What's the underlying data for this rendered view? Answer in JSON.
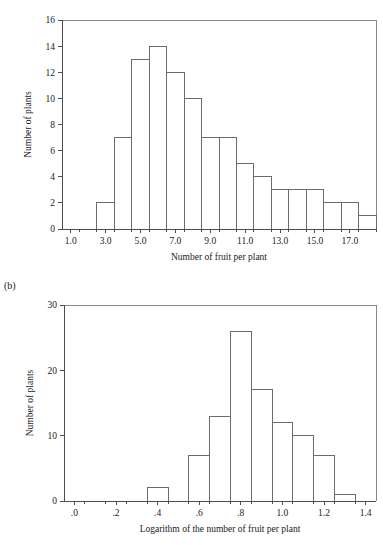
{
  "figure": {
    "panel_b_letter": "(b)"
  },
  "chart_data": [
    {
      "id": "chart-a",
      "type": "bar",
      "title": "",
      "xlabel": "Number of fruit per plant",
      "ylabel": "Number of plants",
      "xlim": [
        0.5,
        18.5
      ],
      "ylim": [
        0,
        16
      ],
      "ytick_values": [
        0,
        2,
        4,
        6,
        8,
        10,
        12,
        14,
        16
      ],
      "ytick_labels": [
        "0",
        "2",
        "4",
        "6",
        "8",
        "10",
        "12",
        "14",
        "16"
      ],
      "xtick_values": [
        1.0,
        3.0,
        5.0,
        7.0,
        9.0,
        11.0,
        13.0,
        15.0,
        17.0
      ],
      "xtick_labels": [
        "1.0",
        "3.0",
        "5.0",
        "7.0",
        "9.0",
        "11.0",
        "13.0",
        "15.0",
        "17.0"
      ],
      "xtick_minor_values": [
        1.5,
        2.5,
        3.5,
        4.5,
        5.5,
        6.5,
        7.5,
        8.5,
        9.5,
        10.5,
        11.5,
        12.5,
        13.5,
        14.5,
        15.5,
        16.5,
        17.5,
        18.5
      ],
      "grid": false,
      "legend": "none",
      "bin_edges": [
        2.5,
        3.5,
        4.5,
        5.5,
        6.5,
        7.5,
        8.5,
        9.5,
        10.5,
        11.5,
        12.5,
        13.5,
        14.5,
        15.5,
        16.5,
        17.5,
        18.5
      ],
      "bin_centers": [
        3,
        4,
        5,
        6,
        7,
        8,
        9,
        10,
        11,
        12,
        13,
        14,
        15,
        16,
        17,
        18
      ],
      "values": [
        2,
        7,
        13,
        14,
        12,
        10,
        7,
        7,
        5,
        4,
        3,
        3,
        3,
        2,
        2,
        1
      ]
    },
    {
      "id": "chart-b",
      "type": "bar",
      "title": "",
      "xlabel": "Logarithm of the number of fruit per plant",
      "ylabel": "Number of plants",
      "xlim": [
        -0.05,
        1.45
      ],
      "ylim": [
        0,
        30
      ],
      "ytick_values": [
        0,
        10,
        20,
        30
      ],
      "ytick_labels": [
        "0",
        "10",
        "20",
        "30"
      ],
      "xtick_values": [
        0.0,
        0.2,
        0.4,
        0.6,
        0.8,
        1.0,
        1.2,
        1.4
      ],
      "xtick_labels": [
        ".0",
        ".2",
        ".4",
        ".6",
        ".8",
        "1.0",
        "1.2",
        "1.4"
      ],
      "xtick_minor_values": [
        0.05,
        0.15,
        0.25,
        0.35,
        0.45,
        0.55,
        0.65,
        0.75,
        0.85,
        0.95,
        1.05,
        1.15,
        1.25,
        1.35
      ],
      "grid": false,
      "legend": "none",
      "bin_edges": [
        0.35,
        0.45,
        0.55,
        0.65,
        0.75,
        0.85,
        0.95,
        1.05,
        1.15,
        1.25,
        1.35
      ],
      "bin_centers": [
        0.4,
        0.5,
        0.6,
        0.7,
        0.8,
        0.9,
        1.0,
        1.1,
        1.2,
        1.3
      ],
      "values": [
        2,
        0,
        7,
        13,
        26,
        17,
        12,
        10,
        7,
        1
      ]
    }
  ],
  "colors": {
    "bar_fill": "#ffffff",
    "bar_stroke": "#6b6b6b",
    "axis": "#4d4d4d",
    "frame": "#8a8a8a",
    "text": "#1a1a1a",
    "background": "#ffffff"
  }
}
